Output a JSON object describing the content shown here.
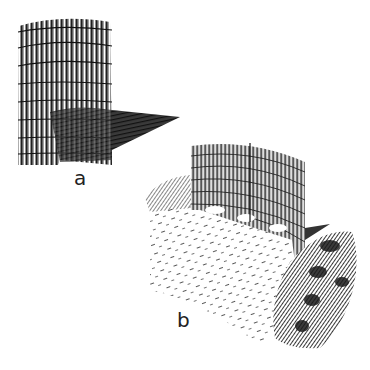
{
  "figure": {
    "panels": [
      {
        "id": "a",
        "label": "a",
        "subject": "cylindrical reed fence with cast shadow"
      },
      {
        "id": "b",
        "label": "b",
        "subject": "curved reed fence on sand dune with vegetation"
      }
    ]
  },
  "colors": {
    "ink": "#1a1a1a",
    "paper": "#ffffff",
    "shade": "#555555"
  }
}
